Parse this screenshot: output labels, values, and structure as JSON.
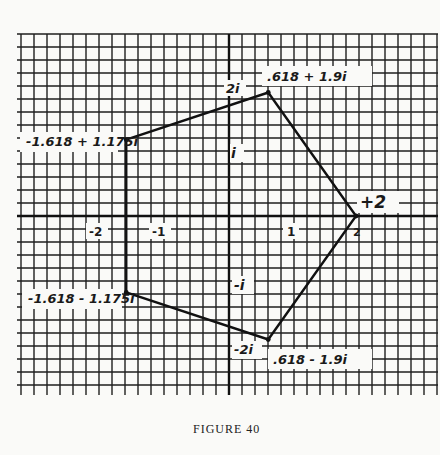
{
  "caption": "FIGURE 40",
  "axis_labels": {
    "x": [
      "-2",
      "-1",
      "1",
      "2"
    ],
    "y": [
      "2i",
      "i",
      "-i",
      "-2i"
    ]
  },
  "vertices": [
    {
      "label": "+2",
      "re": 2,
      "im": 0
    },
    {
      "label": ".618 + 1.9i",
      "re": 0.618,
      "im": 1.9
    },
    {
      "label": "-1.618 + 1.175i",
      "re": -1.618,
      "im": 1.175
    },
    {
      "label": "-1.618 - 1.175i",
      "re": -1.618,
      "im": -1.175
    },
    {
      "label": ".618 - 1.9i",
      "re": 0.618,
      "im": -1.9
    }
  ],
  "colors": {
    "ink": "#1a1a1a",
    "paper": "#fafaf8"
  },
  "chart_data": {
    "type": "scatter",
    "title": "FIGURE 40",
    "xlabel": "Real axis",
    "ylabel": "Imaginary axis",
    "xlim": [
      -2.3,
      2.8
    ],
    "ylim": [
      -2.8,
      2.9
    ],
    "grid": true,
    "grid_step": 0.2,
    "x_ticks": [
      "-2",
      "-1",
      "1",
      "2"
    ],
    "y_ticks": [
      "2i",
      "i",
      "-i",
      "-2i"
    ],
    "series": [
      {
        "name": "pentagon",
        "closed": true,
        "x": [
          2,
          0.618,
          -1.618,
          -1.618,
          0.618
        ],
        "y": [
          0,
          1.9,
          1.175,
          -1.175,
          -1.9
        ],
        "labels": [
          "+2",
          ".618 + 1.9i",
          "-1.618 + 1.175i",
          "-1.618 - 1.175i",
          ".618 - 1.9i"
        ]
      }
    ]
  }
}
